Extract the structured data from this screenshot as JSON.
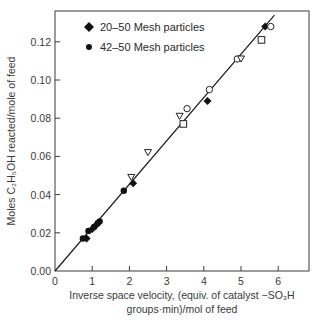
{
  "chart_data": {
    "type": "scatter",
    "title": "",
    "xlabel_line1": "Inverse space velocity, (equiv. of catalyst −SO₃H",
    "xlabel_line2": "groups·min)/mol of feed",
    "ylabel": "Moles C₂H₅OH reacted/mole of feed",
    "xlim": [
      0,
      7
    ],
    "ylim": [
      0,
      0.135
    ],
    "x_ticks": [
      0,
      1,
      2,
      3,
      4,
      5,
      6
    ],
    "x_tick_labels": [
      "0",
      "1",
      "2",
      "3",
      "4",
      "5",
      "6"
    ],
    "y_ticks": [
      0.0,
      0.02,
      0.04,
      0.06,
      0.08,
      0.1,
      0.12
    ],
    "y_tick_labels": [
      "0.00",
      "0.02",
      "0.04",
      "0.06",
      "0.08",
      "0.10",
      "0.12"
    ],
    "grid": false,
    "legend_position": "upper-left",
    "legend": [
      {
        "marker": "diamond-filled",
        "label": "20–50 Mesh particles"
      },
      {
        "marker": "circle-filled",
        "label": "42–50 Mesh particles"
      }
    ],
    "fit_line": {
      "x": [
        0,
        5.9
      ],
      "y": [
        0,
        0.134
      ]
    },
    "series": [
      {
        "name": "20–50 Mesh particles",
        "marker": "diamond-filled",
        "points": [
          [
            0.85,
            0.017
          ],
          [
            1.0,
            0.022
          ],
          [
            1.1,
            0.024
          ],
          [
            2.1,
            0.046
          ],
          [
            4.1,
            0.089
          ],
          [
            5.65,
            0.128
          ]
        ]
      },
      {
        "name": "42–50 Mesh particles",
        "marker": "circle-filled",
        "points": [
          [
            0.75,
            0.017
          ],
          [
            0.9,
            0.021
          ],
          [
            1.05,
            0.023
          ],
          [
            1.15,
            0.025
          ],
          [
            1.2,
            0.026
          ],
          [
            1.85,
            0.042
          ]
        ]
      },
      {
        "name": "open circle",
        "marker": "circle-open",
        "points": [
          [
            3.55,
            0.085
          ],
          [
            4.15,
            0.095
          ],
          [
            4.9,
            0.111
          ],
          [
            5.8,
            0.128
          ]
        ]
      },
      {
        "name": "open triangle",
        "marker": "triangle-open",
        "points": [
          [
            2.05,
            0.049
          ],
          [
            2.5,
            0.062
          ],
          [
            3.35,
            0.081
          ],
          [
            5.0,
            0.111
          ]
        ]
      },
      {
        "name": "open square",
        "marker": "square-open",
        "points": [
          [
            3.45,
            0.077
          ],
          [
            5.55,
            0.121
          ]
        ]
      }
    ]
  }
}
